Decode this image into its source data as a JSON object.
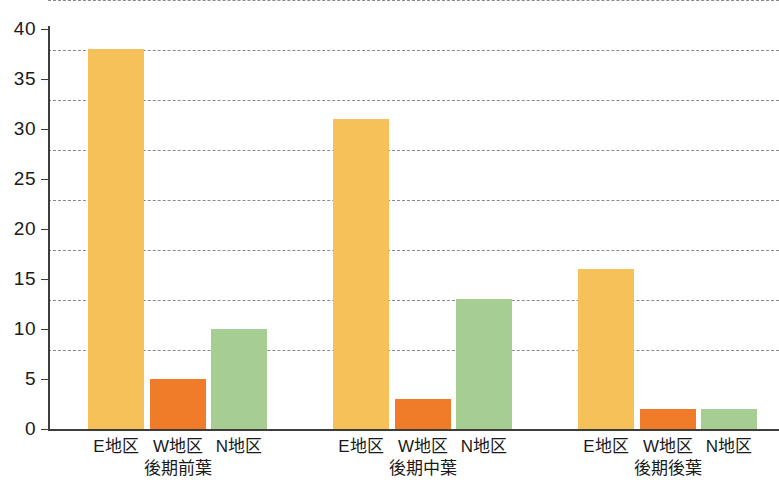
{
  "chart_data": {
    "type": "bar",
    "title": "",
    "subtitle": "",
    "xlabel": "",
    "ylabel": "",
    "ylim": [
      0,
      40
    ],
    "ytick_step": 5,
    "yticks": [
      "40",
      "35",
      "30",
      "25",
      "20",
      "15",
      "10",
      "5",
      "0"
    ],
    "grid": true,
    "legend": "none",
    "categories": [
      "後期前葉",
      "後期中葉",
      "後期後葉"
    ],
    "subcategories": [
      "E地区",
      "W地区",
      "N地区"
    ],
    "series": [
      {
        "name": "E地区",
        "color": "#f7c15a",
        "values": [
          38,
          31,
          16
        ]
      },
      {
        "name": "W地区",
        "color": "#f07b28",
        "values": [
          5,
          3,
          2
        ]
      },
      {
        "name": "N地区",
        "color": "#a6ce92",
        "values": [
          10,
          13,
          2
        ]
      }
    ],
    "bars": [
      {
        "group": "後期前葉",
        "category": "E地区",
        "value": 38,
        "color": "#f7c15a"
      },
      {
        "group": "後期前葉",
        "category": "W地区",
        "value": 5,
        "color": "#f07b28"
      },
      {
        "group": "後期前葉",
        "category": "N地区",
        "value": 10,
        "color": "#a6ce92"
      },
      {
        "group": "後期中葉",
        "category": "E地区",
        "value": 31,
        "color": "#f7c15a"
      },
      {
        "group": "後期中葉",
        "category": "W地区",
        "value": 3,
        "color": "#f07b28"
      },
      {
        "group": "後期中葉",
        "category": "N地区",
        "value": 13,
        "color": "#a6ce92"
      },
      {
        "group": "後期後葉",
        "category": "E地区",
        "value": 16,
        "color": "#f7c15a"
      },
      {
        "group": "後期後葉",
        "category": "W地区",
        "value": 2,
        "color": "#f07b28"
      },
      {
        "group": "後期後葉",
        "category": "N地区",
        "value": 2,
        "color": "#a6ce92"
      }
    ]
  },
  "axis": {
    "y_ticks": [
      {
        "label": "40",
        "value": 40
      },
      {
        "label": "35",
        "value": 35
      },
      {
        "label": "30",
        "value": 30
      },
      {
        "label": "25",
        "value": 25
      },
      {
        "label": "20",
        "value": 20
      },
      {
        "label": "15",
        "value": 15
      },
      {
        "label": "10",
        "value": 10
      },
      {
        "label": "5",
        "value": 5
      },
      {
        "label": "0",
        "value": 0
      }
    ]
  },
  "x_axis": {
    "groups": [
      {
        "label": "後期前葉",
        "ticks": [
          "E地区",
          "W地区",
          "N地区"
        ]
      },
      {
        "label": "後期中葉",
        "ticks": [
          "E地区",
          "W地区",
          "N地区"
        ]
      },
      {
        "label": "後期後葉",
        "ticks": [
          "E地区",
          "W地区",
          "N地区"
        ]
      }
    ]
  },
  "colors": {
    "bar_light_orange": "#f7c15a",
    "bar_orange": "#f07b28",
    "bar_green": "#a6ce92",
    "axis": "#3d3d3d",
    "grid": "#8a8a8a",
    "background": "#ffffff"
  }
}
